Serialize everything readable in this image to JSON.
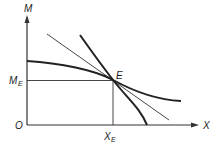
{
  "diagram": {
    "axes": {
      "y_label": "M",
      "x_label": "X",
      "origin_label": "O"
    },
    "point": {
      "label": "E",
      "x_label": "X",
      "x_sub": "E",
      "y_label": "M",
      "y_sub": "E"
    },
    "curves": [
      {
        "name": "flatter-curve",
        "description": "curve through E, flatter slope"
      },
      {
        "name": "steeper-curve",
        "description": "curve through E, steeper slope, reaching X axis"
      },
      {
        "name": "tangent-line",
        "description": "thin straight line through E"
      }
    ],
    "colors": {
      "ink": "#222222",
      "background": "#ffffff"
    }
  }
}
